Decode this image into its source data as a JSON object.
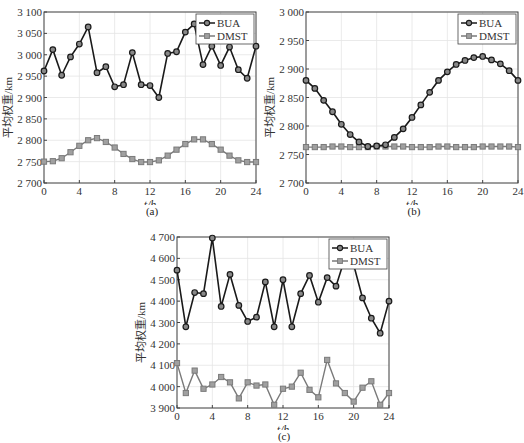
{
  "figure": {
    "captions": [
      "(a)",
      "(b)",
      "(c)"
    ]
  },
  "colors": {
    "bua": "#1a1a1a",
    "dmst": "#7a7a7a",
    "grid": "#e4e4e4",
    "axis": "#444444"
  },
  "chart_data": [
    {
      "id": "a",
      "type": "line",
      "title": "",
      "xlabel": "t/h",
      "ylabel": "平均权重/km",
      "xlim": [
        0,
        24
      ],
      "ylim": [
        2700,
        3100
      ],
      "xticks": [
        0,
        4,
        8,
        12,
        16,
        20,
        24
      ],
      "yticks": [
        2700,
        2750,
        2800,
        2850,
        2900,
        2950,
        3000,
        3050,
        3100
      ],
      "ytick_labels": [
        "2 700",
        "2 750",
        "2 800",
        "2 850",
        "2 900",
        "2 950",
        "3 000",
        "3 050",
        "3 100"
      ],
      "grid": true,
      "legend_position": "upper right",
      "x": [
        0,
        1,
        2,
        3,
        4,
        5,
        6,
        7,
        8,
        9,
        10,
        11,
        12,
        13,
        14,
        15,
        16,
        17,
        18,
        19,
        20,
        21,
        22,
        23,
        24
      ],
      "series": [
        {
          "name": "BUA",
          "marker": "circle",
          "values": [
            2962,
            3012,
            2952,
            2995,
            3025,
            3065,
            2958,
            2972,
            2925,
            2930,
            3005,
            2930,
            2928,
            2900,
            3003,
            3007,
            3053,
            3072,
            2977,
            3020,
            2975,
            3018,
            2965,
            2945,
            3020
          ]
        },
        {
          "name": "DMST",
          "marker": "square",
          "values": [
            2750,
            2751,
            2758,
            2772,
            2787,
            2800,
            2805,
            2796,
            2783,
            2768,
            2756,
            2749,
            2749,
            2753,
            2764,
            2778,
            2791,
            2802,
            2802,
            2791,
            2778,
            2764,
            2753,
            2749,
            2749
          ]
        }
      ],
      "caption": "(a)"
    },
    {
      "id": "b",
      "type": "line",
      "title": "",
      "xlabel": "t/h",
      "ylabel": "平均权重/km",
      "xlim": [
        0,
        24
      ],
      "ylim": [
        2700,
        3000
      ],
      "xticks": [
        0,
        4,
        8,
        12,
        16,
        20,
        24
      ],
      "yticks": [
        2700,
        2750,
        2800,
        2850,
        2900,
        2950,
        3000
      ],
      "ytick_labels": [
        "2 700",
        "2 750",
        "2 800",
        "2 850",
        "2 900",
        "2 950",
        "3 000"
      ],
      "grid": true,
      "legend_position": "upper right",
      "x": [
        0,
        1,
        2,
        3,
        4,
        5,
        6,
        7,
        8,
        9,
        10,
        11,
        12,
        13,
        14,
        15,
        16,
        17,
        18,
        19,
        20,
        21,
        22,
        23,
        24
      ],
      "series": [
        {
          "name": "BUA",
          "marker": "circle",
          "values": [
            2880,
            2866,
            2845,
            2825,
            2803,
            2785,
            2772,
            2764,
            2765,
            2767,
            2780,
            2795,
            2815,
            2837,
            2859,
            2880,
            2895,
            2908,
            2915,
            2920,
            2922,
            2916,
            2909,
            2897,
            2880
          ]
        },
        {
          "name": "DMST",
          "marker": "square",
          "values": [
            2763,
            2763,
            2763,
            2764,
            2764,
            2763,
            2763,
            2763,
            2764,
            2764,
            2764,
            2764,
            2763,
            2763,
            2763,
            2764,
            2764,
            2763,
            2763,
            2763,
            2764,
            2764,
            2764,
            2764,
            2763
          ]
        }
      ],
      "caption": "(b)"
    },
    {
      "id": "c",
      "type": "line",
      "title": "",
      "xlabel": "t/h",
      "ylabel": "平均权重/km",
      "xlim": [
        0,
        24
      ],
      "ylim": [
        3900,
        4700
      ],
      "xticks": [
        0,
        4,
        8,
        12,
        16,
        20,
        24
      ],
      "yticks": [
        3900,
        4000,
        4100,
        4200,
        4300,
        4400,
        4500,
        4600,
        4700
      ],
      "ytick_labels": [
        "3 900",
        "4 000",
        "4 100",
        "4 200",
        "4 300",
        "4 400",
        "4 500",
        "4 600",
        "4 700"
      ],
      "grid": true,
      "legend_position": "upper right",
      "x": [
        0,
        1,
        2,
        3,
        4,
        5,
        6,
        7,
        8,
        9,
        10,
        11,
        12,
        13,
        14,
        15,
        16,
        17,
        18,
        19,
        20,
        21,
        22,
        23,
        24
      ],
      "series": [
        {
          "name": "BUA",
          "marker": "circle",
          "values": [
            4545,
            4280,
            4440,
            4435,
            4695,
            4375,
            4525,
            4380,
            4305,
            4325,
            4490,
            4280,
            4500,
            4280,
            4435,
            4520,
            4395,
            4510,
            4470,
            4600,
            4570,
            4415,
            4320,
            4250,
            4400
          ]
        },
        {
          "name": "DMST",
          "marker": "square",
          "values": [
            4110,
            3970,
            4075,
            3990,
            4010,
            4045,
            4020,
            3945,
            4020,
            4005,
            4010,
            3915,
            3990,
            4000,
            4065,
            3985,
            3950,
            4125,
            4015,
            3970,
            3930,
            3995,
            4025,
            3915,
            3970
          ]
        }
      ],
      "caption": "(c)"
    }
  ]
}
